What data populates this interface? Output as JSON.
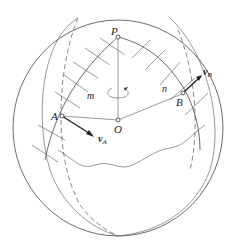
{
  "figure": {
    "labels": {
      "P": "P",
      "O": "O",
      "A": "A",
      "B": "B",
      "m": "m",
      "n": "n",
      "vA": "v",
      "vA_sub": "A",
      "vB": "v",
      "vB_sub": "B"
    },
    "colors": {
      "line": "#444444",
      "background": "#ffffff"
    }
  }
}
